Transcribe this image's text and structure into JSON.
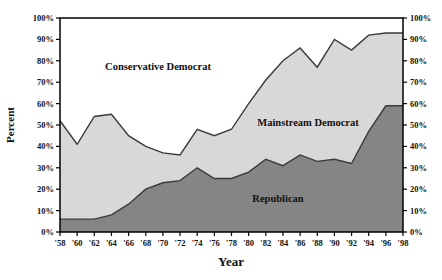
{
  "chart_data": {
    "type": "area",
    "stacked": true,
    "normalized_to_100": true,
    "title": "",
    "xlabel": "Year",
    "ylabel": "Percent",
    "ylim": [
      0,
      100
    ],
    "grid": false,
    "legend": "labels-inside-areas",
    "x_tick_labels": [
      "'58",
      "'60",
      "'62",
      "'64",
      "'66",
      "'68",
      "'70",
      "'72",
      "'74",
      "'76",
      "'78",
      "'80",
      "'82",
      "'84",
      "'86",
      "'88",
      "'90",
      "'92",
      "'94",
      "'96",
      "'98"
    ],
    "y_tick_labels": [
      "0%",
      "10%",
      "20%",
      "30%",
      "40%",
      "50%",
      "60%",
      "70%",
      "80%",
      "90%",
      "100%"
    ],
    "y_axis_sides": [
      "left",
      "right"
    ],
    "colors": {
      "republican_fill": "#858585",
      "mainstream_fill": "#d8d8d8",
      "conservative_fill": "#ffffff",
      "boundary_line": "#3a3a3a",
      "axis_line": "#000000"
    },
    "series": [
      {
        "name": "Republican",
        "color": "#858585",
        "values": [
          6,
          6,
          6,
          8,
          13,
          20,
          23,
          24,
          30,
          25,
          25,
          28,
          34,
          31,
          36,
          33,
          34,
          32,
          47,
          59,
          59
        ]
      },
      {
        "name": "Mainstream Democrat",
        "color": "#d8d8d8",
        "values": [
          46,
          35,
          48,
          47,
          32,
          20,
          14,
          12,
          18,
          20,
          23,
          32,
          37,
          49,
          50,
          44,
          56,
          53,
          45,
          34,
          34
        ]
      },
      {
        "name": "Conservative Democrat",
        "color": "#ffffff",
        "values": [
          48,
          59,
          46,
          45,
          55,
          60,
          63,
          64,
          52,
          55,
          52,
          40,
          29,
          20,
          14,
          23,
          10,
          15,
          8,
          7,
          7
        ]
      }
    ]
  }
}
